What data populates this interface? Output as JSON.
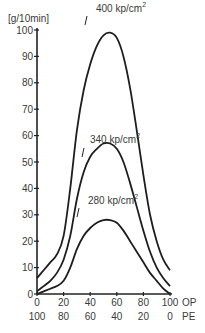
{
  "chart_data": {
    "type": "line",
    "title": "",
    "ylabel": "[g/10min]",
    "xlabel_primary": "OP",
    "xlabel_secondary": "PE",
    "ylim": [
      0,
      100
    ],
    "xlim": [
      0,
      100
    ],
    "y_ticks": [
      "0",
      "10",
      "20",
      "30",
      "40",
      "50",
      "60",
      "70",
      "80",
      "90",
      "100"
    ],
    "x_ticks_op": [
      "0",
      "20",
      "40",
      "60",
      "80",
      "100"
    ],
    "x_ticks_pe": [
      "100",
      "80",
      "60",
      "40",
      "20",
      "0"
    ],
    "grid": false,
    "legend": "inline curve annotations",
    "series": [
      {
        "name": "400 kp/cm2",
        "label_main": "400 kp/cm",
        "label_sup": "2",
        "x": [
          0,
          5,
          10,
          15,
          20,
          25,
          30,
          35,
          40,
          45,
          50,
          55,
          60,
          65,
          70,
          75,
          80,
          85,
          90,
          95,
          100
        ],
        "y": [
          6,
          9,
          12,
          15,
          22,
          40,
          62,
          77,
          87,
          94,
          98,
          99,
          97,
          90,
          78,
          62,
          45,
          30,
          20,
          13,
          9
        ]
      },
      {
        "name": "340 kp/cm2",
        "label_main": "340 kp/cm",
        "label_sup": "2",
        "x": [
          0,
          5,
          10,
          15,
          20,
          25,
          30,
          35,
          40,
          45,
          50,
          55,
          60,
          65,
          70,
          75,
          80,
          85,
          90,
          95,
          100
        ],
        "y": [
          1,
          3,
          5,
          8,
          13,
          22,
          36,
          46,
          52,
          55,
          57,
          57,
          55,
          50,
          42,
          33,
          24,
          16,
          10,
          6,
          3
        ]
      },
      {
        "name": "280 kp/cm2",
        "label_main": "280 kp/cm",
        "label_sup": "2",
        "x": [
          0,
          5,
          10,
          15,
          20,
          25,
          30,
          35,
          40,
          45,
          50,
          55,
          60,
          65,
          70,
          75,
          80,
          85,
          90,
          95,
          100
        ],
        "y": [
          0,
          1,
          2,
          3,
          5,
          10,
          17,
          22,
          25,
          27,
          28,
          28,
          27,
          24,
          20,
          16,
          12,
          8,
          5,
          2,
          0
        ]
      }
    ]
  }
}
